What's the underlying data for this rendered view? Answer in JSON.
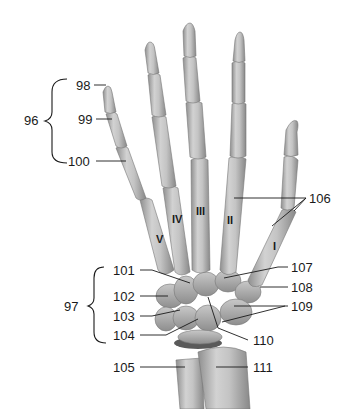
{
  "figure": {
    "bone_color": "#b8b8b8",
    "bone_shadow": "#8a8a8a",
    "bone_highlight": "#e6e6e6",
    "line_color": "#1a1a1a"
  },
  "groups": [
    {
      "id": "96",
      "label": "96"
    },
    {
      "id": "97",
      "label": "97"
    }
  ],
  "labels_left": [
    {
      "id": "98",
      "label": "98"
    },
    {
      "id": "99",
      "label": "99"
    },
    {
      "id": "100",
      "label": "100"
    },
    {
      "id": "101",
      "label": "101"
    },
    {
      "id": "102",
      "label": "102"
    },
    {
      "id": "103",
      "label": "103"
    },
    {
      "id": "104",
      "label": "104"
    },
    {
      "id": "105",
      "label": "105"
    }
  ],
  "labels_right": [
    {
      "id": "106",
      "label": "106"
    },
    {
      "id": "107",
      "label": "107"
    },
    {
      "id": "108",
      "label": "108"
    },
    {
      "id": "109",
      "label": "109"
    },
    {
      "id": "110",
      "label": "110"
    },
    {
      "id": "111",
      "label": "111"
    }
  ],
  "metacarpals": [
    {
      "id": "V",
      "label": "V"
    },
    {
      "id": "IV",
      "label": "IV"
    },
    {
      "id": "III",
      "label": "III"
    },
    {
      "id": "II",
      "label": "II"
    },
    {
      "id": "I",
      "label": "I"
    }
  ]
}
